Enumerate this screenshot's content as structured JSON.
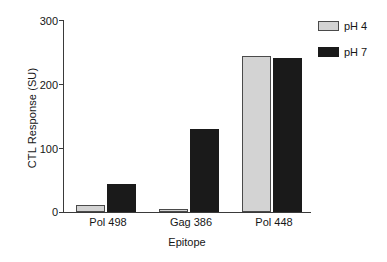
{
  "chart_data": {
    "type": "bar",
    "title": "",
    "subtitle": "",
    "xlabel": "Epitope",
    "ylabel": "CTL Response (SU)",
    "categories": [
      "Pol 498",
      "Gag 386",
      "Pol 448"
    ],
    "series": [
      {
        "name": "pH 4",
        "color": "#d3d3d3",
        "values": [
          11,
          4,
          244
        ]
      },
      {
        "name": "pH 7",
        "color": "#1a1a1a",
        "values": [
          44,
          129,
          241
        ]
      }
    ],
    "ylim": [
      0,
      300
    ],
    "yticks": [
      0,
      100,
      200,
      300
    ],
    "ytick_labels": [
      "0",
      "100",
      "200",
      "300"
    ],
    "grid": false,
    "legend_position": "top-right-outside",
    "background_color": "#ffffff",
    "axis_color": "#3a3a3a"
  }
}
